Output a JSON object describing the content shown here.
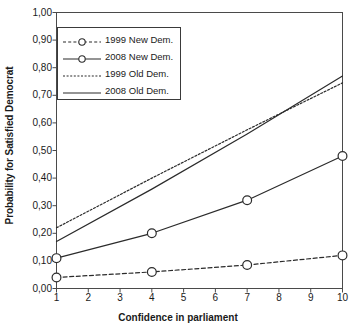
{
  "chart_data": {
    "type": "line",
    "title": "",
    "xlabel": "Confidence in parliament",
    "ylabel": "Probability for Satisfied Democrat",
    "xlim": [
      1,
      10
    ],
    "ylim": [
      0,
      1
    ],
    "grid": false,
    "legend_position": "top-left",
    "x_ticks": [
      "1",
      "2",
      "3",
      "4",
      "5",
      "6",
      "7",
      "8",
      "9",
      "10"
    ],
    "x_tick_values": [
      1,
      2,
      3,
      4,
      5,
      6,
      7,
      8,
      9,
      10
    ],
    "y_ticks": [
      "0,00",
      "0,10",
      "0,20",
      "0,30",
      "0,40",
      "0,50",
      "0,60",
      "0,70",
      "0,80",
      "0,90",
      "1,00"
    ],
    "y_tick_values": [
      0.0,
      0.1,
      0.2,
      0.3,
      0.4,
      0.5,
      0.6,
      0.7,
      0.8,
      0.9,
      1.0
    ],
    "decimal_separator": ",",
    "series": [
      {
        "name": "1999 New Dem.",
        "style": "dashed",
        "marker": "circle",
        "color": "#2b2b2b",
        "x": [
          1,
          4,
          7,
          10
        ],
        "values": [
          0.04,
          0.06,
          0.085,
          0.12
        ]
      },
      {
        "name": "2008 New Dem.",
        "style": "solid",
        "marker": "circle",
        "color": "#2b2b2b",
        "x": [
          1,
          4,
          7,
          10
        ],
        "values": [
          0.11,
          0.2,
          0.32,
          0.48
        ]
      },
      {
        "name": "1999 Old Dem.",
        "style": "dotted",
        "marker": "none",
        "color": "#2b2b2b",
        "x": [
          1,
          4,
          7,
          10
        ],
        "values": [
          0.22,
          0.4,
          0.575,
          0.745
        ]
      },
      {
        "name": "2008 Old Dem.",
        "style": "solid",
        "marker": "none",
        "color": "#2b2b2b",
        "x": [
          1,
          4,
          7,
          10
        ],
        "values": [
          0.17,
          0.36,
          0.56,
          0.77
        ]
      }
    ]
  },
  "legend": {
    "entries": [
      {
        "label": "1999 New Dem."
      },
      {
        "label": "2008 New Dem."
      },
      {
        "label": "1999 Old Dem."
      },
      {
        "label": "2008 Old Dem."
      }
    ]
  },
  "axes": {
    "x_title": "Confidence in parliament",
    "y_title": "Probability for Satisfied Democrat"
  }
}
